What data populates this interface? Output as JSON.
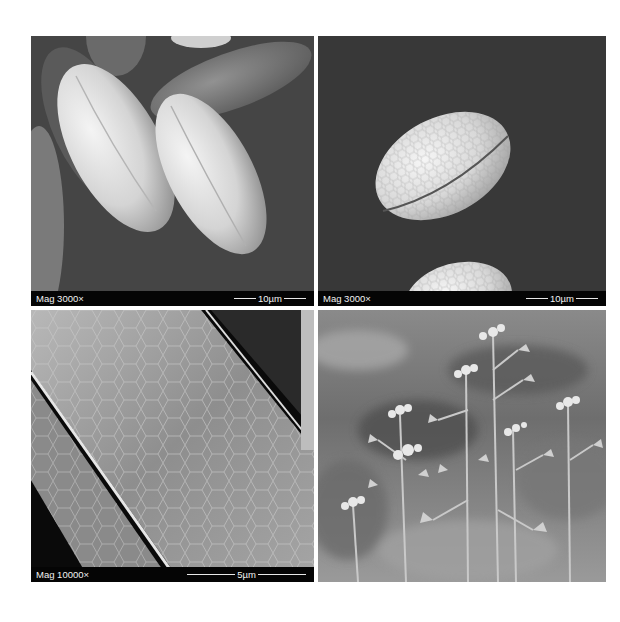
{
  "figure": {
    "panels": [
      {
        "id": "top-left",
        "description": "SEM micrograph of elongated pollen grains with furrows on dark background",
        "magnification_label": "Mag 3000×",
        "scale_bar_label": "10µm",
        "scale_bar_line_width": 22
      },
      {
        "id": "top-right",
        "description": "SEM micrograph of single ellipsoid pollen grain with reticulate surface",
        "magnification_label": "Mag 3000×",
        "scale_bar_label": "10µm",
        "scale_bar_line_width": 22
      },
      {
        "id": "bottom-left",
        "description": "SEM close-up of pollen grain surface showing reticulate cell pattern",
        "magnification_label": "Mag 10000×",
        "scale_bar_label": "5µm",
        "scale_bar_line_width": 48
      },
      {
        "id": "bottom-right",
        "description": "Black and white photograph of flowering shepherd's purse plants with heart-shaped seed pods",
        "magnification_label": "",
        "scale_bar_label": ""
      }
    ],
    "colors": {
      "background": "#ffffff",
      "label_bar": "#050505",
      "label_text": "#f2f2f2",
      "sem_background": "#3a3a3a"
    }
  }
}
